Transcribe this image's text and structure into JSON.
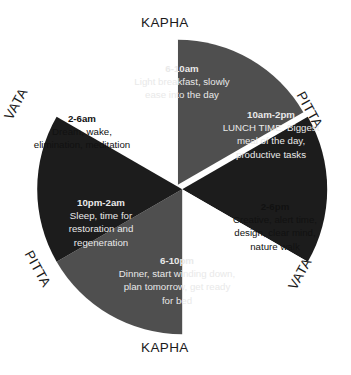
{
  "colors": {
    "kapha_fill": "#4f4f4f",
    "pitta_fill": "#1c1c1c",
    "vata_fill": "#ffffff",
    "background": "#ffffff",
    "light_text": "#e9e9e9",
    "dark_text": "#111111"
  },
  "ring_labels": {
    "kapha_top": "KAPHA",
    "kapha_bottom": "KAPHA",
    "vata_left": "VATA",
    "vata_right": "VATA",
    "pitta_right": "PITTA",
    "pitta_left": "PITTA"
  },
  "chart_data": {
    "type": "pie",
    "legend": "none",
    "grid": false,
    "center": [
      180,
      187
    ],
    "radius": 145,
    "categories": [
      "6-10am",
      "10am-2pm",
      "2-6pm",
      "6-10pm",
      "10pm-2am",
      "2-6am"
    ],
    "values": [
      60,
      60,
      60,
      60,
      60,
      60
    ],
    "units": "degrees",
    "slices": [
      {
        "time": "6-10am",
        "dosha": "KAPHA",
        "description": "Light breakfast, slowly ease into the day",
        "start_angle": -90,
        "end_angle": -30,
        "fill": "#4f4f4f",
        "text_color": "#e9e9e9"
      },
      {
        "time": "10am-2pm",
        "dosha": "PITTA",
        "description": "LUNCH TIME. Biggest meal of the day, productive tasks",
        "start_angle": -30,
        "end_angle": 30,
        "fill": "#1c1c1c",
        "text_color": "#e9e9e9"
      },
      {
        "time": "2-6pm",
        "dosha": "VATA",
        "description": "Creative, alert time, design, clear mind, nature walk",
        "start_angle": 30,
        "end_angle": 90,
        "fill": "#ffffff",
        "text_color": "#111111"
      },
      {
        "time": "6-10pm",
        "dosha": "KAPHA",
        "description": "Dinner, start winding down, plan tomorrow, get ready for bed",
        "start_angle": 90,
        "end_angle": 150,
        "fill": "#4f4f4f",
        "text_color": "#e9e9e9"
      },
      {
        "time": "10pm-2am",
        "dosha": "PITTA",
        "description": "Sleep, time for restoration and regeneration",
        "start_angle": 150,
        "end_angle": 210,
        "fill": "#1c1c1c",
        "text_color": "#e9e9e9"
      },
      {
        "time": "2-6am",
        "dosha": "VATA",
        "description": "Dream, wake, elimination, meditation",
        "start_angle": 210,
        "end_angle": 270,
        "fill": "#ffffff",
        "text_color": "#111111"
      }
    ]
  }
}
